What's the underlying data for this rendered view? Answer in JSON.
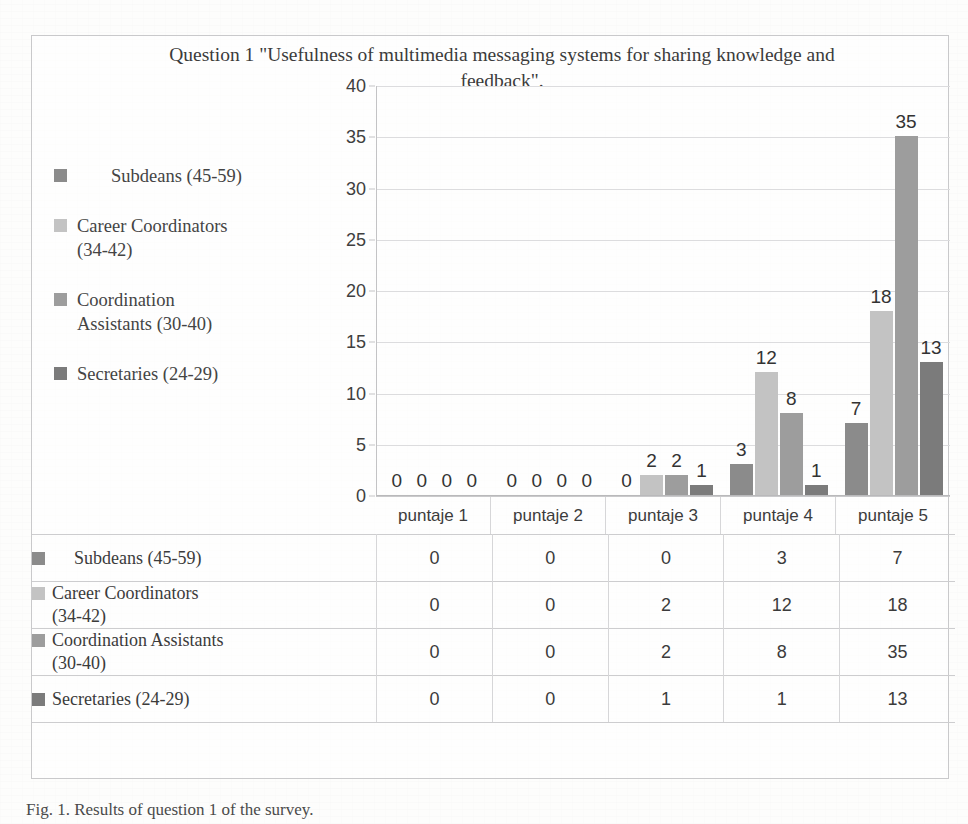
{
  "figure": {
    "caption": "Fig. 1. Results of question 1 of the survey."
  },
  "chart_data": {
    "type": "bar",
    "title": "Question 1 \"Usefulness of multimedia messaging systems for sharing knowledge and feedback\".",
    "xlabel": "",
    "ylabel": "",
    "ylim": [
      0,
      40
    ],
    "ytick_step": 5,
    "yticks": [
      "40",
      "35",
      "30",
      "25",
      "20",
      "15",
      "10",
      "5",
      "0"
    ],
    "grid": true,
    "legend_position": "left",
    "categories": [
      "puntaje 1",
      "puntaje 2",
      "puntaje 3",
      "puntaje 4",
      "puntaje 5"
    ],
    "series": [
      {
        "name": "Subdeans (45-59)",
        "color": "#8b8b8b",
        "values": [
          0,
          0,
          0,
          3,
          7
        ],
        "labels": [
          "0",
          "0",
          "0",
          "3",
          "7"
        ]
      },
      {
        "name": "Career Coordinators\n(34-42)",
        "color": "#c3c3c3",
        "values": [
          0,
          0,
          2,
          12,
          18
        ],
        "labels": [
          "0",
          "0",
          "2",
          "12",
          "18"
        ]
      },
      {
        "name": "Coordination\nAssistants (30-40)",
        "color": "#9d9d9d",
        "values": [
          0,
          0,
          2,
          8,
          35
        ],
        "labels": [
          "0",
          "0",
          "2",
          "8",
          "35"
        ]
      },
      {
        "name": "Secretaries (24-29)",
        "color": "#7b7b7b",
        "values": [
          0,
          0,
          1,
          1,
          13
        ],
        "labels": [
          "0",
          "0",
          "1",
          "1",
          "13"
        ]
      }
    ]
  },
  "table": {
    "column_headers": [
      "puntaje 1",
      "puntaje 2",
      "puntaje 3",
      "puntaje 4",
      "puntaje 5"
    ],
    "rows": [
      {
        "label": "Subdeans (45-59)",
        "color": "#8b8b8b",
        "indent": true,
        "values": [
          "0",
          "0",
          "0",
          "3",
          "7"
        ]
      },
      {
        "label": "Career Coordinators\n(34-42)",
        "color": "#c3c3c3",
        "indent": false,
        "values": [
          "0",
          "0",
          "2",
          "12",
          "18"
        ]
      },
      {
        "label": "Coordination Assistants\n(30-40)",
        "color": "#9d9d9d",
        "indent": false,
        "values": [
          "0",
          "0",
          "2",
          "8",
          "35"
        ]
      },
      {
        "label": "Secretaries (24-29)",
        "color": "#7b7b7b",
        "indent": false,
        "values": [
          "0",
          "0",
          "1",
          "1",
          "13"
        ]
      }
    ]
  }
}
